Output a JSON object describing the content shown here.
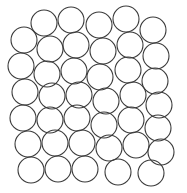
{
  "figure": {
    "type": "circle-packing-diagram",
    "width": 187,
    "height": 193,
    "background_color": "#ffffff",
    "stroke_color": "#3a3a3a",
    "stroke_width": 1.1,
    "fill": "none",
    "circle_count": 38,
    "radius": 13
  },
  "chart_data": {
    "type": "scatter",
    "subtitle": "",
    "xlabel": "",
    "ylabel": "",
    "xlim": [
      0,
      187
    ],
    "ylim": [
      0,
      193
    ],
    "grid": false,
    "legend": "none",
    "marker": "open-circle",
    "marker_radius": 13,
    "series": [
      {
        "name": "circles",
        "points": [
          {
            "x": 44,
            "y": 23
          },
          {
            "x": 71,
            "y": 20
          },
          {
            "x": 99,
            "y": 25
          },
          {
            "x": 126,
            "y": 19
          },
          {
            "x": 153,
            "y": 30
          },
          {
            "x": 24,
            "y": 40
          },
          {
            "x": 50,
            "y": 49
          },
          {
            "x": 76,
            "y": 45
          },
          {
            "x": 103,
            "y": 51
          },
          {
            "x": 130,
            "y": 45
          },
          {
            "x": 156,
            "y": 56
          },
          {
            "x": 21,
            "y": 66
          },
          {
            "x": 47,
            "y": 74
          },
          {
            "x": 74,
            "y": 71
          },
          {
            "x": 100,
            "y": 77
          },
          {
            "x": 128,
            "y": 70
          },
          {
            "x": 155,
            "y": 81
          },
          {
            "x": 25,
            "y": 92
          },
          {
            "x": 52,
            "y": 96
          },
          {
            "x": 79,
            "y": 95
          },
          {
            "x": 106,
            "y": 101
          },
          {
            "x": 133,
            "y": 95
          },
          {
            "x": 159,
            "y": 105
          },
          {
            "x": 23,
            "y": 118
          },
          {
            "x": 50,
            "y": 120
          },
          {
            "x": 77,
            "y": 118
          },
          {
            "x": 104,
            "y": 125
          },
          {
            "x": 131,
            "y": 120
          },
          {
            "x": 158,
            "y": 128
          },
          {
            "x": 28,
            "y": 144
          },
          {
            "x": 55,
            "y": 143
          },
          {
            "x": 82,
            "y": 143
          },
          {
            "x": 109,
            "y": 148
          },
          {
            "x": 136,
            "y": 145
          },
          {
            "x": 161,
            "y": 152
          },
          {
            "x": 31,
            "y": 170
          },
          {
            "x": 58,
            "y": 169
          },
          {
            "x": 85,
            "y": 169
          },
          {
            "x": 118,
            "y": 172
          },
          {
            "x": 151,
            "y": 173
          }
        ]
      }
    ]
  }
}
